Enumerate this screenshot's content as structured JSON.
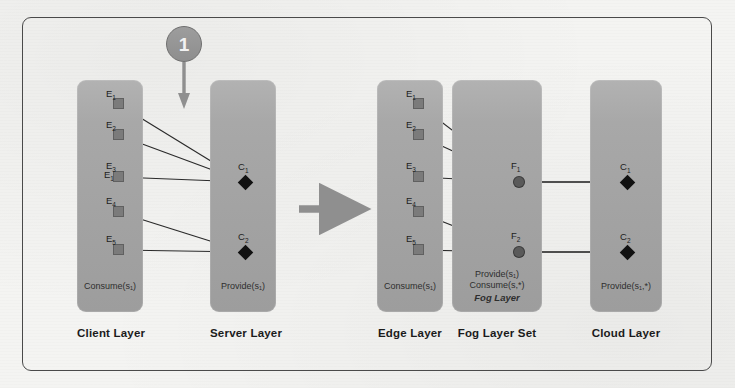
{
  "figure": {
    "frame_color": "#4a4a4a",
    "background_color": "#f4f4f2"
  },
  "annotation": {
    "step_badge_label": "1",
    "step_badge_icon": "numbered-circle-badge",
    "step_arrow_icon": "arrow-down-icon",
    "transform_arrow_icon": "arrow-right-icon"
  },
  "colors": {
    "layer_fill": "#a5a5a5",
    "square_node": "#7b7b7b",
    "circle_node": "#5a5a5a",
    "diamond_node": "#111111",
    "edge_line": "#2a2a2a",
    "caption_text": "#1b1b1b",
    "arrow_gray": "#8f8f8f"
  },
  "left_diagram": {
    "layers": [
      {
        "id": "client-layer",
        "caption": "Client Layer",
        "notes": [
          "Consume(s₁)"
        ],
        "nodes": [
          {
            "id": "E1",
            "label": "E",
            "sub": "1",
            "shape": "square"
          },
          {
            "id": "E2",
            "label": "E",
            "sub": "2",
            "shape": "square"
          },
          {
            "id": "E3",
            "label": "E",
            "sub": "3",
            "shape": "square"
          },
          {
            "id": "E4",
            "label": "E",
            "sub": "4",
            "shape": "square"
          },
          {
            "id": "E5",
            "label": "E",
            "sub": "5",
            "shape": "square"
          }
        ]
      },
      {
        "id": "server-layer",
        "caption": "Server Layer",
        "notes": [
          "Provide(s₁)"
        ],
        "nodes": [
          {
            "id": "C1",
            "label": "C",
            "sub": "1",
            "shape": "diamond"
          },
          {
            "id": "C2",
            "label": "C",
            "sub": "2",
            "shape": "diamond"
          }
        ]
      }
    ],
    "edges": [
      {
        "from": "E1",
        "to": "C1"
      },
      {
        "from": "E2",
        "to": "C1"
      },
      {
        "from": "E3",
        "to": "C1"
      },
      {
        "from": "E4",
        "to": "C2"
      },
      {
        "from": "E5",
        "to": "C2"
      }
    ]
  },
  "right_diagram": {
    "layers": [
      {
        "id": "edge-layer",
        "caption": "Edge Layer",
        "notes": [
          "Consume(s₁)"
        ],
        "nodes": [
          {
            "id": "E1r",
            "label": "E",
            "sub": "1",
            "shape": "square"
          },
          {
            "id": "E2r",
            "label": "E",
            "sub": "2",
            "shape": "square"
          },
          {
            "id": "E3r",
            "label": "E",
            "sub": "3",
            "shape": "square"
          },
          {
            "id": "E4r",
            "label": "E",
            "sub": "4",
            "shape": "square"
          },
          {
            "id": "E5r",
            "label": "E",
            "sub": "5",
            "shape": "square"
          }
        ]
      },
      {
        "id": "fog-layer-set",
        "caption": "Fog Layer Set",
        "notes": [
          "Provide(s₁)",
          "Consume(s,*)",
          "Fog Layer"
        ],
        "nodes": [
          {
            "id": "F1",
            "label": "F",
            "sub": "1",
            "shape": "circle"
          },
          {
            "id": "F2",
            "label": "F",
            "sub": "2",
            "shape": "circle"
          }
        ]
      },
      {
        "id": "cloud-layer",
        "caption": "Cloud Layer",
        "notes": [
          "Provide(s₁,*)"
        ],
        "nodes": [
          {
            "id": "C1r",
            "label": "C",
            "sub": "1",
            "shape": "diamond"
          },
          {
            "id": "C2r",
            "label": "C",
            "sub": "2",
            "shape": "diamond"
          }
        ]
      }
    ],
    "edges": [
      {
        "from": "E1r",
        "to": "F1"
      },
      {
        "from": "E2r",
        "to": "F1"
      },
      {
        "from": "E3r",
        "to": "F1"
      },
      {
        "from": "E4r",
        "to": "F2"
      },
      {
        "from": "E5r",
        "to": "F2"
      },
      {
        "from": "F1",
        "to": "C1r"
      },
      {
        "from": "F2",
        "to": "C2r"
      }
    ]
  }
}
